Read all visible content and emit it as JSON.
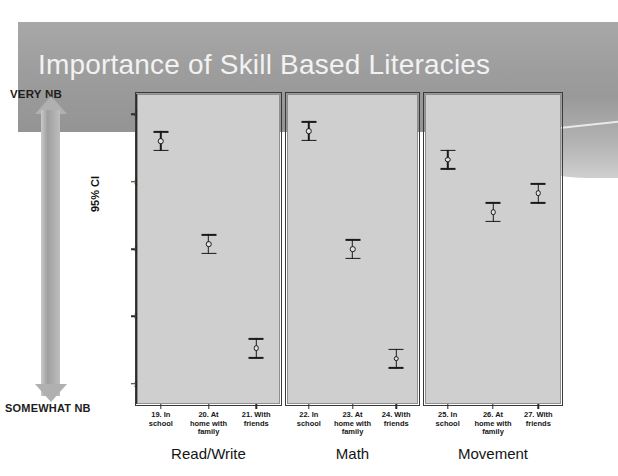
{
  "slide": {
    "title": "Importance of Skill Based Literacies"
  },
  "importance_axis": {
    "top_label": "VERY NB",
    "bottom_label": "SOMEWHAT NB",
    "arrow_icon": "double-headed-vertical-arrow-icon"
  },
  "chart_data": {
    "type": "scatter",
    "title": "Importance of Skill Based Literacies",
    "xlabel": "",
    "ylabel": "95% CI",
    "ylim": [
      2.74,
      3.66
    ],
    "yticks": [
      3.6,
      3.4,
      3.2,
      3.0,
      2.8
    ],
    "ytick_labels": [
      "3.6",
      "3.4",
      "3.2",
      "3.0",
      "2.8"
    ],
    "grid": false,
    "legend": "none",
    "error_bar_note": "95% confidence interval bars with mean marker",
    "panels": [
      {
        "name": "Read/Write",
        "categories": [
          "19. In school",
          "20. At home with family",
          "21. With friends"
        ],
        "category_lines": [
          [
            "19. In",
            "school"
          ],
          [
            "20. At",
            "home with",
            "family"
          ],
          [
            "21. With",
            "friends"
          ]
        ],
        "values": [
          3.52,
          3.215,
          2.905
        ],
        "ci_low": [
          3.49,
          3.185,
          2.875
        ],
        "ci_high": [
          3.55,
          3.245,
          2.935
        ]
      },
      {
        "name": "Math",
        "categories": [
          "22. In school",
          "23. At home with family",
          "24. With friends"
        ],
        "category_lines": [
          [
            "22. In",
            "school"
          ],
          [
            "23. At",
            "home with",
            "family"
          ],
          [
            "24. With",
            "friends"
          ]
        ],
        "values": [
          3.55,
          3.2,
          2.875
        ],
        "ci_low": [
          3.52,
          3.17,
          2.845
        ],
        "ci_high": [
          3.58,
          3.23,
          2.905
        ]
      },
      {
        "name": "Movement",
        "categories": [
          "25. In school",
          "26. At home with family",
          "27. With friends"
        ],
        "category_lines": [
          [
            "25. In",
            "school"
          ],
          [
            "26. At",
            "home with",
            "family"
          ],
          [
            "27. With",
            "friends"
          ]
        ],
        "values": [
          3.465,
          3.31,
          3.365
        ],
        "ci_low": [
          3.435,
          3.28,
          3.335
        ],
        "ci_high": [
          3.495,
          3.34,
          3.395
        ]
      }
    ]
  },
  "colors": {
    "banner": "#9d9d9d",
    "title_text": "#f2f2f2",
    "panel_fill": "#cfcfcf",
    "panel_border": "#3a3a3a",
    "marker": "#1a1a1a",
    "arrow": "#b0b0b0"
  }
}
